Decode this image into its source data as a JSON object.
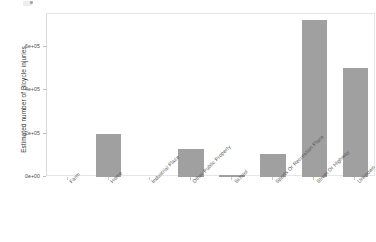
{
  "chart_data": {
    "type": "bar",
    "title": "",
    "xlabel": "",
    "ylabel": "Estimated number of Bicycle injuries",
    "categories": [
      "Farm",
      "Home",
      "Industrial Place",
      "Other Public Property",
      "School",
      "Sports Or Recreation Place",
      "Street Or Highway",
      "Unknown"
    ],
    "values": [
      0,
      200000,
      0,
      130000,
      10000,
      105000,
      725000,
      505000
    ],
    "value_labels": [
      "0",
      "2e+05",
      "0",
      "1.3e+05",
      "1e+04",
      "1.05e+05",
      "7.25e+05",
      "5.05e+05"
    ],
    "ylim": [
      0,
      760000
    ],
    "yticks": [
      0,
      200000,
      400000,
      600000
    ],
    "ytick_labels": [
      "0e+00",
      "2e+05",
      "4e+05",
      "6e+05"
    ],
    "grid": false,
    "legend": false,
    "bar_color": "#a0a0a0",
    "panel_background": "#ffffff",
    "panel_border_color": "#e6e6e6",
    "axis_text_color": "#4a4a4a"
  }
}
